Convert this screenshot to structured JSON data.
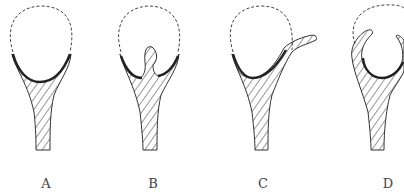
{
  "figure": {
    "panels": [
      {
        "id": "A",
        "label": "A",
        "label_x": 36,
        "description": "dashed crown outline seated on hatched root with thick dark seat"
      },
      {
        "id": "B",
        "label": "B",
        "label_x": 143,
        "description": "hatched root with central post projecting into dashed crown"
      },
      {
        "id": "C",
        "label": "C",
        "label_x": 253,
        "description": "hatched root with a lateral arm extending up to the right"
      },
      {
        "id": "D",
        "label": "D",
        "label_x": 378,
        "description": "hatched root with two curved arms cupping around crown"
      }
    ],
    "colors": {
      "line": "#333333",
      "seat": "#222222",
      "background": "#ffffff"
    }
  }
}
